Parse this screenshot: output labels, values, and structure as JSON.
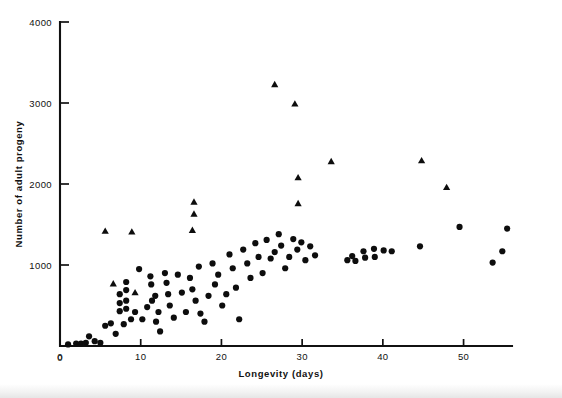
{
  "figure": {
    "background": "#ffffff",
    "marker_color": "#0d0d0d",
    "axis_color": "#111111"
  },
  "chart_data": {
    "type": "scatter",
    "title": "",
    "xlabel": "Longevity (days)",
    "ylabel": "Number of adult progeny",
    "xlim": [
      0,
      56
    ],
    "ylim": [
      0,
      4000
    ],
    "xticks": [
      0,
      10,
      20,
      30,
      40,
      50
    ],
    "xtick_labels": [
      "0",
      "10",
      "20",
      "30",
      "40",
      "50"
    ],
    "yticks": [
      0,
      1000,
      2000,
      3000,
      4000
    ],
    "ytick_labels": [
      "0",
      "1000",
      "2000",
      "3000",
      "4000"
    ],
    "grid": false,
    "legend": "none",
    "series": [
      {
        "name": "circles",
        "marker": "circle",
        "color": "#0d0d0d",
        "points": [
          [
            1.0,
            20
          ],
          [
            2.0,
            30
          ],
          [
            2.6,
            30
          ],
          [
            3.2,
            40
          ],
          [
            3.6,
            120
          ],
          [
            4.3,
            60
          ],
          [
            5.0,
            40
          ],
          [
            5.6,
            250
          ],
          [
            6.3,
            280
          ],
          [
            6.9,
            150
          ],
          [
            7.4,
            430
          ],
          [
            7.4,
            530
          ],
          [
            7.4,
            640
          ],
          [
            7.9,
            270
          ],
          [
            8.2,
            790
          ],
          [
            8.2,
            690
          ],
          [
            8.2,
            560
          ],
          [
            8.2,
            460
          ],
          [
            8.8,
            330
          ],
          [
            9.3,
            420
          ],
          [
            9.8,
            950
          ],
          [
            10.2,
            330
          ],
          [
            10.8,
            480
          ],
          [
            11.2,
            860
          ],
          [
            11.3,
            760
          ],
          [
            11.4,
            560
          ],
          [
            11.8,
            620
          ],
          [
            11.9,
            300
          ],
          [
            12.2,
            420
          ],
          [
            12.4,
            180
          ],
          [
            13.0,
            900
          ],
          [
            13.2,
            780
          ],
          [
            13.4,
            640
          ],
          [
            13.6,
            500
          ],
          [
            14.1,
            350
          ],
          [
            14.6,
            880
          ],
          [
            15.1,
            660
          ],
          [
            15.6,
            420
          ],
          [
            16.1,
            840
          ],
          [
            16.4,
            700
          ],
          [
            16.8,
            560
          ],
          [
            17.2,
            980
          ],
          [
            17.4,
            400
          ],
          [
            17.9,
            300
          ],
          [
            18.4,
            620
          ],
          [
            18.9,
            1020
          ],
          [
            19.2,
            760
          ],
          [
            19.6,
            880
          ],
          [
            20.1,
            500
          ],
          [
            20.6,
            640
          ],
          [
            21.0,
            1130
          ],
          [
            21.4,
            960
          ],
          [
            21.8,
            720
          ],
          [
            22.2,
            330
          ],
          [
            22.7,
            1190
          ],
          [
            23.2,
            1020
          ],
          [
            23.6,
            840
          ],
          [
            24.2,
            1270
          ],
          [
            24.6,
            1100
          ],
          [
            25.1,
            900
          ],
          [
            25.6,
            1310
          ],
          [
            26.1,
            1080
          ],
          [
            26.6,
            1160
          ],
          [
            27.1,
            1380
          ],
          [
            27.4,
            1240
          ],
          [
            27.9,
            960
          ],
          [
            28.4,
            1100
          ],
          [
            28.9,
            1320
          ],
          [
            29.4,
            1190
          ],
          [
            29.9,
            1280
          ],
          [
            30.4,
            1060
          ],
          [
            31.0,
            1230
          ],
          [
            31.6,
            1120
          ],
          [
            35.6,
            1060
          ],
          [
            36.2,
            1110
          ],
          [
            36.6,
            1050
          ],
          [
            37.6,
            1170
          ],
          [
            37.8,
            1090
          ],
          [
            38.9,
            1200
          ],
          [
            39.0,
            1100
          ],
          [
            40.1,
            1180
          ],
          [
            41.1,
            1170
          ],
          [
            44.6,
            1230
          ],
          [
            49.5,
            1470
          ],
          [
            53.6,
            1030
          ],
          [
            54.8,
            1170
          ],
          [
            55.4,
            1450
          ]
        ]
      },
      {
        "name": "triangles",
        "marker": "triangle",
        "color": "#0d0d0d",
        "points": [
          [
            6.6,
            770
          ],
          [
            9.3,
            660
          ],
          [
            5.6,
            1420
          ],
          [
            8.9,
            1410
          ],
          [
            16.4,
            1430
          ],
          [
            16.6,
            1630
          ],
          [
            16.6,
            1780
          ],
          [
            26.6,
            3230
          ],
          [
            29.1,
            2990
          ],
          [
            29.5,
            2080
          ],
          [
            29.5,
            1760
          ],
          [
            33.6,
            2280
          ],
          [
            44.8,
            2290
          ],
          [
            47.9,
            1960
          ]
        ]
      }
    ]
  }
}
